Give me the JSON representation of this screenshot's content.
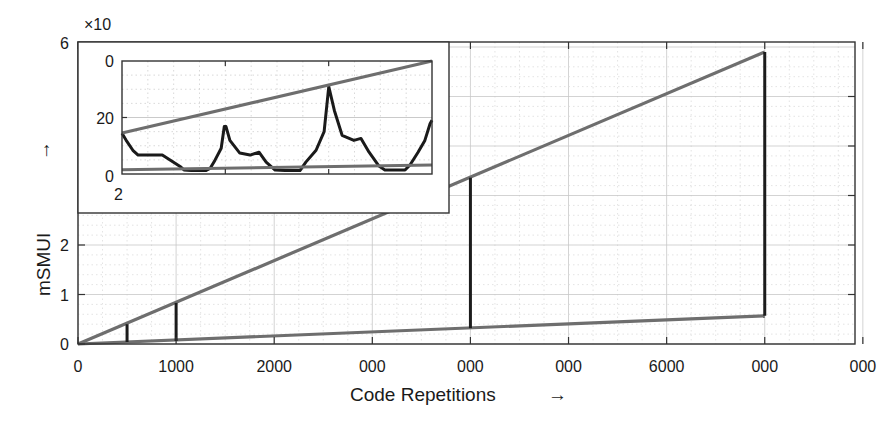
{
  "chart_data": {
    "type": "line",
    "title": "",
    "xlabel": "Code Repetitions",
    "xlabel_arrow": "→",
    "ylabel": "mSMUI",
    "ylabel_arrow": "→",
    "xlim": [
      0,
      8000
    ],
    "ylim": [
      0,
      6
    ],
    "grid": true,
    "minor_grid": true,
    "x_ticks": [
      0,
      1000,
      2000,
      3000,
      4000,
      5000,
      6000,
      7000,
      8000
    ],
    "x_tick_labels": [
      "0",
      "1000",
      "2000",
      "000",
      "000",
      "000",
      "6000",
      "000",
      "000"
    ],
    "y_ticks": [
      0,
      1,
      2,
      6
    ],
    "y_tick_labels": [
      "0",
      "1",
      "2",
      "6"
    ],
    "right_y_ticks": [
      1,
      2,
      3,
      4,
      5
    ],
    "series": [
      {
        "name": "upper-bound",
        "color": "#6e6e6e",
        "x": [
          0,
          7000
        ],
        "y": [
          0,
          5.9
        ]
      },
      {
        "name": "lower-bound",
        "color": "#6e6e6e",
        "x": [
          0,
          7000
        ],
        "y": [
          0,
          0.57
        ]
      }
    ],
    "vertical_segments": [
      {
        "x": 500,
        "y_from": 0.04,
        "y_to": 0.4
      },
      {
        "x": 1000,
        "y_from": 0.06,
        "y_to": 0.83
      },
      {
        "x": 4000,
        "y_from": 0.32,
        "y_to": 3.36
      },
      {
        "x": 7000,
        "y_from": 0.57,
        "y_to": 5.9
      }
    ],
    "inset": {
      "exponent_label": "×10",
      "y_tick_labels": [
        "0",
        "20",
        "0"
      ],
      "y_ticks": [
        0,
        20,
        40
      ],
      "x_start_label": "2",
      "xlim": [
        0,
        1
      ],
      "ylim": [
        0,
        40
      ],
      "x_ticks": [
        0.3333,
        0.6667
      ],
      "upper_line": {
        "x": [
          0,
          1
        ],
        "y": [
          14.5,
          40
        ]
      },
      "lower_line": {
        "x": [
          0,
          1
        ],
        "y": [
          1.5,
          3.2
        ]
      },
      "curve": {
        "x": [
          0,
          0.013,
          0.035,
          0.052,
          0.08,
          0.13,
          0.17,
          0.19,
          0.2,
          0.223,
          0.27,
          0.285,
          0.3,
          0.32,
          0.33,
          0.3355,
          0.348,
          0.38,
          0.413,
          0.442,
          0.465,
          0.494,
          0.526,
          0.574,
          0.593,
          0.626,
          0.652,
          0.667,
          0.685,
          0.71,
          0.748,
          0.771,
          0.797,
          0.829,
          0.848,
          0.913,
          0.929,
          0.955,
          0.977,
          0.994,
          1.0
        ],
        "y": [
          14.4,
          12.0,
          8.4,
          6.7,
          6.7,
          6.7,
          3.9,
          2.5,
          1.4,
          1.2,
          1.2,
          2.1,
          4.9,
          9.1,
          16.8,
          16.8,
          11.9,
          7.4,
          6.7,
          7.7,
          4.2,
          1.4,
          1.2,
          1.2,
          4.2,
          8.4,
          15.0,
          30.9,
          22.5,
          13.7,
          11.9,
          12.6,
          7.7,
          2.8,
          1.4,
          1.4,
          3.2,
          7.7,
          11.9,
          17.9,
          19.0
        ]
      }
    }
  }
}
